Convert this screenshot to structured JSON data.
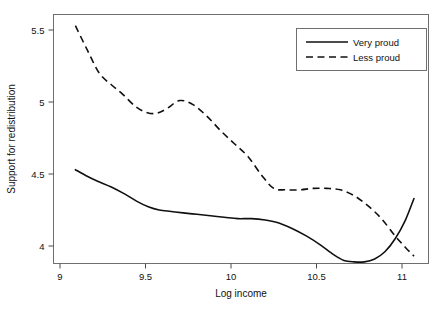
{
  "chart_data": {
    "type": "line",
    "title": "",
    "xlabel": "Log income",
    "ylabel": "Support for redistribution",
    "xlim": [
      9.05,
      11.12
    ],
    "ylim": [
      3.85,
      5.58
    ],
    "xticks": [
      9,
      9.5,
      10,
      10.5,
      11
    ],
    "xticklabels": [
      "9",
      "9.5",
      "10",
      "10.5",
      "11"
    ],
    "yticks": [
      4,
      4.5,
      5,
      5.5
    ],
    "yticklabels": [
      "4",
      "4.5",
      "5",
      "5.5"
    ],
    "grid": false,
    "legend_position": "top-right",
    "series": [
      {
        "name": "Very proud",
        "style": "solid",
        "color": "#101010",
        "x": [
          9.09,
          9.15,
          9.22,
          9.3,
          9.38,
          9.45,
          9.52,
          9.58,
          9.65,
          9.72,
          9.8,
          9.88,
          9.96,
          10.04,
          10.12,
          10.2,
          10.28,
          10.36,
          10.44,
          10.52,
          10.6,
          10.66,
          10.72,
          10.78,
          10.84,
          10.9,
          10.96,
          11.02,
          11.07
        ],
        "y": [
          4.53,
          4.49,
          4.45,
          4.41,
          4.36,
          4.31,
          4.27,
          4.25,
          4.24,
          4.23,
          4.22,
          4.21,
          4.2,
          4.19,
          4.19,
          4.18,
          4.16,
          4.12,
          4.07,
          4.01,
          3.94,
          3.9,
          3.89,
          3.89,
          3.91,
          3.96,
          4.05,
          4.18,
          4.33
        ]
      },
      {
        "name": "Less proud",
        "style": "dashed",
        "color": "#101010",
        "x": [
          9.09,
          9.16,
          9.23,
          9.3,
          9.37,
          9.44,
          9.5,
          9.56,
          9.62,
          9.7,
          9.78,
          9.86,
          9.94,
          10.02,
          10.1,
          10.18,
          10.25,
          10.32,
          10.4,
          10.48,
          10.56,
          10.64,
          10.72,
          10.8,
          10.88,
          10.96,
          11.02,
          11.07
        ],
        "y": [
          5.53,
          5.36,
          5.2,
          5.12,
          5.05,
          4.97,
          4.93,
          4.92,
          4.95,
          5.01,
          4.98,
          4.9,
          4.8,
          4.71,
          4.62,
          4.49,
          4.4,
          4.39,
          4.39,
          4.4,
          4.4,
          4.39,
          4.35,
          4.28,
          4.19,
          4.07,
          3.99,
          3.93
        ]
      }
    ]
  },
  "legend": {
    "entries": [
      {
        "label": "Very proud"
      },
      {
        "label": "Less proud"
      }
    ]
  },
  "axes": {
    "x_title": "Log income",
    "y_title": "Support for redistribution"
  }
}
